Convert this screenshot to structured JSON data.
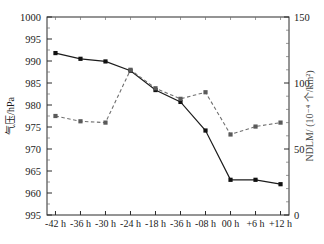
{
  "chart_data": {
    "type": "line",
    "title": "",
    "xlabel": "",
    "categories": [
      "-42 h",
      "-36 h",
      "-30 h",
      "-24 h",
      "-18 h",
      "-36 h",
      "-08 h",
      "00 h",
      "+6 h",
      "+12 h"
    ],
    "grid": false,
    "legend_position": "none",
    "axes": {
      "left": {
        "label": "气压/hPa",
        "ticks": [
          "1000",
          "995",
          "990",
          "985",
          "980",
          "975",
          "970",
          "965",
          "960",
          "995"
        ],
        "tick_values": [
          1000,
          995,
          990,
          985,
          980,
          975,
          970,
          965,
          960,
          955
        ],
        "ylim": [
          955,
          1000
        ],
        "minor_ticks_per_interval": 1
      },
      "right": {
        "label": "NDLM/ (10⁻⁴ 个/km²)",
        "ticks": [
          "150",
          "100",
          "50",
          "0"
        ],
        "tick_values": [
          150,
          100,
          50,
          0
        ],
        "ylim": [
          0,
          150
        ],
        "minor_ticks_per_interval": 4
      }
    },
    "series": [
      {
        "name": "气压",
        "axis": "left",
        "style": "solid",
        "marker": "square",
        "color": "#1c1c1c",
        "values": [
          991.8,
          990.5,
          989.9,
          987.8,
          983.4,
          980.7,
          974.2,
          963.0,
          963.0,
          962.0
        ]
      },
      {
        "name": "NDLM",
        "axis": "right",
        "style": "dashed",
        "marker": "square",
        "color": "#707070",
        "values": [
          75,
          71,
          70,
          110,
          96,
          88,
          93,
          61,
          67,
          70
        ]
      }
    ]
  }
}
